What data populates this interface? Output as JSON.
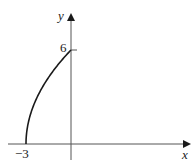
{
  "chart_data": {
    "type": "line",
    "title": "",
    "xlabel": "x",
    "ylabel": "y",
    "series": [
      {
        "name": "curve",
        "x": [
          -3,
          -2.9,
          -2.75,
          -2.5,
          -2.25,
          -2,
          -1.5,
          -1,
          -0.5,
          0
        ],
        "y": [
          0,
          1.1,
          1.73,
          2.45,
          3.0,
          3.46,
          4.24,
          4.9,
          5.48,
          6
        ]
      }
    ],
    "tick_labels": {
      "x": [
        "-3"
      ],
      "y": [
        "6"
      ]
    },
    "xlim": [
      -3.5,
      7.9
    ],
    "ylim": [
      -1,
      8.5
    ],
    "grid": false,
    "legend": null
  },
  "labels": {
    "x_axis": "x",
    "y_axis": "y",
    "x_tick": "−3",
    "y_tick": "6"
  },
  "colors": {
    "axis": "#555555",
    "curve": "#1a1a1a",
    "text": "#1a1a1a"
  }
}
